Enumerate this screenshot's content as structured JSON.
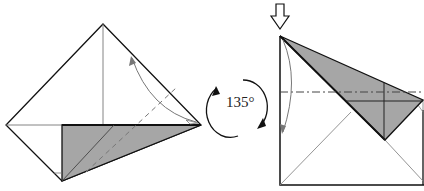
{
  "diagram": {
    "type": "origami-fold-step",
    "rotation_label": "135°",
    "colors": {
      "paper_front": "#ffffff",
      "paper_back": "#a6a6a6",
      "line": "#111111",
      "crease": "#808080",
      "arrow": "#777777"
    },
    "steps": [
      {
        "name": "before",
        "description": "Valley fold top-right edge down to crease; dashed valley fold line"
      },
      {
        "name": "after",
        "description": "Rotated result with push-in arrow and dash-dot fold line"
      }
    ]
  }
}
